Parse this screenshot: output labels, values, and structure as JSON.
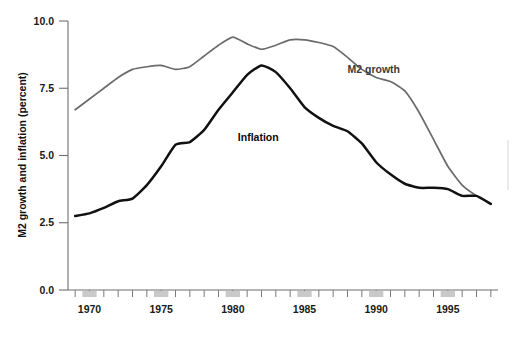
{
  "chart_data": {
    "type": "line",
    "title": "",
    "xlabel": "",
    "ylabel": "M2 growth and inflation (percent)",
    "xlim": [
      1968.5,
      1998.5
    ],
    "ylim": [
      0.0,
      10.0
    ],
    "grid": false,
    "legend_position": "inline-annotations",
    "ytick_labels": [
      "0.0",
      "2.5",
      "5.0",
      "7.5",
      "10.0"
    ],
    "ytick_values": [
      0.0,
      2.5,
      5.0,
      7.5,
      10.0
    ],
    "xtick_labels": [
      "1970",
      "1975",
      "1980",
      "1985",
      "1990",
      "1995"
    ],
    "xtick_values": [
      1970,
      1975,
      1980,
      1985,
      1990,
      1995
    ],
    "x": [
      1969,
      1970,
      1971,
      1972,
      1973,
      1974,
      1975,
      1976,
      1977,
      1978,
      1979,
      1980,
      1981,
      1982,
      1983,
      1984,
      1985,
      1986,
      1987,
      1988,
      1989,
      1990,
      1991,
      1992,
      1993,
      1994,
      1995,
      1996,
      1997,
      1998
    ],
    "series": [
      {
        "name": "M2 growth",
        "color": "#6b6b6b",
        "label_x": 1988.0,
        "label_y": 8.05,
        "values": [
          6.7,
          7.1,
          7.5,
          7.9,
          8.2,
          8.3,
          8.35,
          8.2,
          8.3,
          8.7,
          9.1,
          9.4,
          9.15,
          8.95,
          9.1,
          9.3,
          9.3,
          9.2,
          9.05,
          8.65,
          8.2,
          7.9,
          7.75,
          7.4,
          6.6,
          5.6,
          4.6,
          3.9,
          3.5,
          3.2
        ]
      },
      {
        "name": "Inflation",
        "color": "#111111",
        "label_x": 1983.2,
        "label_y": 5.55,
        "values": [
          2.75,
          2.85,
          3.05,
          3.3,
          3.4,
          3.9,
          4.6,
          5.4,
          5.5,
          5.95,
          6.7,
          7.35,
          8.0,
          8.35,
          8.1,
          7.5,
          6.8,
          6.4,
          6.1,
          5.9,
          5.45,
          4.75,
          4.3,
          3.95,
          3.8,
          3.8,
          3.75,
          3.5,
          3.5,
          3.2
        ]
      }
    ]
  },
  "axis": {
    "y_title": "M2 growth and inflation (percent)"
  }
}
